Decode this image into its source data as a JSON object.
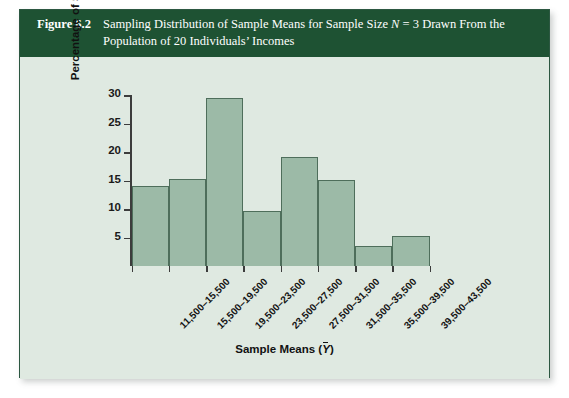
{
  "figure": {
    "number_label": "Figure 6.2",
    "title_line1_pre": "Sampling Distribution of Sample Means for Sample Size ",
    "title_line1_n": "N",
    "title_line1_post": " = 3 Drawn From the",
    "title_line2": "Population of 20 Individuals’ Incomes",
    "header_color": "#1e5233",
    "panel_color": "#dfe9e1",
    "bar_fill_color": "#9cbaa7",
    "bar_edge_color": "#4e6e5b"
  },
  "chart_data": {
    "type": "bar",
    "title": "Sampling Distribution of Sample Means for Sample Size N = 3 Drawn From the Population of 20 Individuals’ Incomes",
    "xlabel": "Sample Means (Ȳ)",
    "ylabel": "Percentage of Samples",
    "categories": [
      "11,500–15,500",
      "15,500–19,500",
      "19,500–23,500",
      "23,500–27,500",
      "27,500–31,500",
      "31,500–35,500",
      "35,500–39,500",
      "39,500–43,500"
    ],
    "values": [
      14.0,
      15.2,
      29.5,
      9.7,
      19.1,
      15.1,
      3.5,
      5.3
    ],
    "ylim": [
      0,
      30
    ],
    "yticks": [
      5,
      10,
      15,
      20,
      25,
      30
    ],
    "ytick_labels": [
      "5",
      "10",
      "15",
      "20",
      "25",
      "30"
    ],
    "grid": false,
    "legend": false,
    "bar_gap": 0,
    "xtick_label_rotation": -45
  }
}
